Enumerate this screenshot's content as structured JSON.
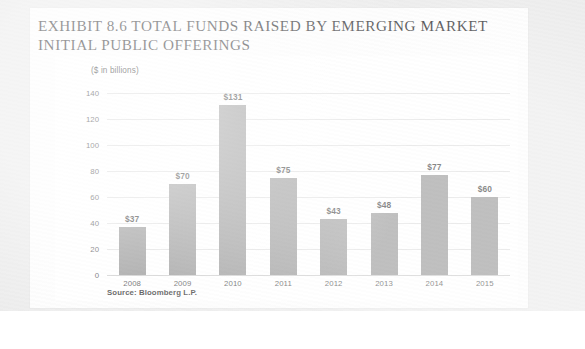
{
  "page": {
    "title_line1": "EXHIBIT 8.6 TOTAL FUNDS RAISED BY EMERGING MARKET",
    "title_line2": "INITIAL PUBLIC OFFERINGS",
    "title_full": "EXHIBIT 8.6 TOTAL FUNDS RAISED BY EMERGING MARKET\nINITIAL PUBLIC OFFERINGS",
    "units_label": "($ in billions)",
    "source_note": "Source: Bloomberg L.P."
  },
  "colors": {
    "bar_fill": "#8b8b8b",
    "gridline": "#dcdcdc",
    "baseline": "#c6c6c6",
    "page_background": "#fdfdfd",
    "scan_border": "#e9e9e9",
    "text": "#1f1f1f"
  },
  "chart_data": {
    "type": "bar",
    "title": "EXHIBIT 8.6 TOTAL FUNDS RAISED BY EMERGING MARKET INITIAL PUBLIC OFFERINGS",
    "subtitle": "($ in billions)",
    "xlabel": "",
    "ylabel": "($ in billions)",
    "categories": [
      "2008",
      "2009",
      "2010",
      "2011",
      "2012",
      "2013",
      "2014",
      "2015"
    ],
    "values": [
      37,
      70,
      131,
      75,
      43,
      48,
      77,
      60
    ],
    "data_labels": [
      "$37",
      "$70",
      "$131",
      "$75",
      "$43",
      "$48",
      "$77",
      "$60"
    ],
    "ylim": [
      0,
      140
    ],
    "yticks": [
      0,
      20,
      40,
      60,
      80,
      100,
      120,
      140
    ],
    "ytick_labels": [
      "0",
      "20",
      "40",
      "60",
      "80",
      "100",
      "120",
      "140"
    ],
    "grid": true,
    "grid_axis": "y",
    "legend": false,
    "legend_position": "none",
    "source": "Source: Bloomberg L.P."
  }
}
